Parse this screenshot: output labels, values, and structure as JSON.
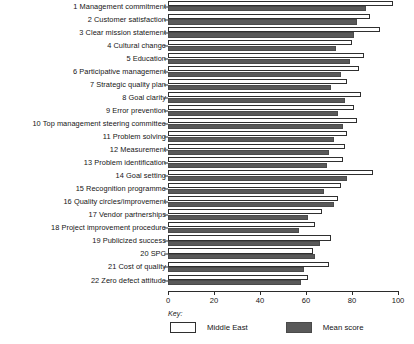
{
  "chart_data": {
    "type": "bar",
    "orientation": "horizontal",
    "title": "",
    "xlabel": "",
    "ylabel": "",
    "xlim": [
      0,
      100
    ],
    "xticks": [
      0,
      20,
      40,
      60,
      80,
      100
    ],
    "grid": false,
    "legend_position": "bottom-left",
    "legend_title": "Key:",
    "categories": [
      "1 Management commitment",
      "2 Customer satisfaction",
      "3 Clear mission statement",
      "4 Cultural change",
      "5 Education",
      "6 Participative management",
      "7 Strategic quality plan",
      "8 Goal clarity",
      "9 Error prevention",
      "10 Top management steering committee",
      "11 Problem solving",
      "12 Measurement",
      "13 Problem identification",
      "14 Goal setting",
      "15 Recognition programme",
      "16 Quality circles/improvement",
      "17 Vendor partnerships",
      "18 Project improvement procedure",
      "19 Publicized success",
      "20 SPC",
      "21 Cost of quality",
      "22 Zero defect attitude"
    ],
    "series": [
      {
        "name": "Middle East",
        "color": "#ffffff",
        "values": [
          98,
          88,
          92,
          80,
          85,
          83,
          78,
          84,
          81,
          82,
          78,
          77,
          76,
          89,
          75,
          74,
          67,
          64,
          71,
          63,
          70,
          61
        ]
      },
      {
        "name": "Mean score",
        "color": "#595959",
        "values": [
          86,
          82,
          81,
          73,
          79,
          75,
          71,
          77,
          74,
          76,
          72,
          70,
          69,
          78,
          68,
          72,
          61,
          57,
          66,
          64,
          59,
          58
        ]
      }
    ]
  },
  "legend": {
    "title": "Key:",
    "items": [
      {
        "label": "Middle East",
        "swatch": "light"
      },
      {
        "label": "Mean score",
        "swatch": "dark"
      }
    ]
  },
  "axis": {
    "ticks": [
      "0",
      "20",
      "40",
      "60",
      "80",
      "100"
    ]
  }
}
